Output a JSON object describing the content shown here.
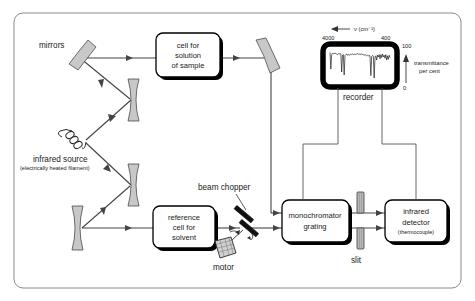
{
  "diagram": {
    "background_color": "#ffffff",
    "frame_color": "#8a8a8a",
    "beam_color": "#444444",
    "wire_color": "#555555",
    "mirror_fill": "#c8c8c8",
    "slit_fill": "#b8b8b8"
  },
  "labels": {
    "mirrors": "mirrors",
    "infrared_source": "infrared source",
    "infrared_source_sub": "(electrically heated filament)",
    "beam_chopper": "beam chopper",
    "motor": "motor",
    "recorder": "recorder",
    "slit": "slit"
  },
  "boxes": {
    "sample_cell": {
      "line1": "cell for",
      "line2": "solution",
      "line3": "of sample"
    },
    "reference_cell": {
      "line1": "reference",
      "line2": "cell for",
      "line3": "solvent"
    },
    "monochromator": {
      "line1": "monochromator",
      "line2": "grating"
    },
    "detector": {
      "line1": "infrared",
      "line2": "detector",
      "line3": "(thermocouple)"
    }
  },
  "chart_data": {
    "type": "line",
    "title": "",
    "xlabel": "ν (cm⁻¹)",
    "ylabel": "transmittance per cent",
    "xlim": [
      4000,
      400
    ],
    "ylim": [
      0,
      100
    ],
    "x_ticks": [
      4000,
      400
    ],
    "x_tick_labels": [
      "4000",
      "400"
    ],
    "y_ticks": [
      0,
      100
    ],
    "y_tick_labels": [
      "0",
      "100"
    ],
    "x_axis_direction": "decreasing-left-to-right",
    "x_arrow": "←",
    "y_arrow": "↑",
    "grid": false,
    "legend": null,
    "series": [
      {
        "name": "transmittance",
        "x": [
          4000,
          3950,
          3900,
          3850,
          3800,
          3750,
          3700,
          3650,
          3600,
          3550,
          3500,
          3450,
          3400,
          3350,
          3300,
          3250,
          3200,
          3150,
          3100,
          3050,
          3000,
          2950,
          2900,
          2850,
          2800,
          2750,
          2700,
          2650,
          2600,
          2550,
          2500,
          2450,
          2400,
          2350,
          2300,
          2250,
          2200,
          2150,
          2100,
          2050,
          2000,
          1950,
          1900,
          1850,
          1800,
          1750,
          1700,
          1650,
          1600,
          1550,
          1500,
          1450,
          1400,
          1350,
          1300,
          1250,
          1200,
          1150,
          1100,
          1050,
          1000,
          950,
          900,
          850,
          800,
          750,
          700,
          650,
          600,
          550,
          500,
          450,
          400
        ],
        "values": [
          95,
          40,
          88,
          92,
          90,
          93,
          91,
          92,
          90,
          88,
          91,
          90,
          92,
          90,
          30,
          86,
          88,
          20,
          85,
          88,
          90,
          86,
          88,
          86,
          88,
          90,
          88,
          90,
          88,
          89,
          90,
          88,
          90,
          91,
          90,
          89,
          90,
          88,
          90,
          89,
          88,
          86,
          88,
          86,
          84,
          86,
          84,
          85,
          84,
          18,
          82,
          85,
          83,
          10,
          80,
          84,
          70,
          86,
          80,
          88,
          74,
          88,
          78,
          90,
          80,
          86,
          76,
          88,
          70,
          84,
          72,
          86,
          78
        ]
      }
    ]
  }
}
